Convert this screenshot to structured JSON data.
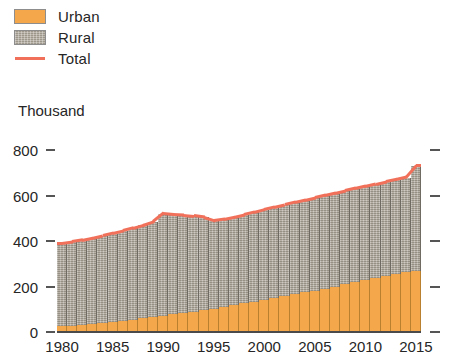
{
  "legend": {
    "items": [
      {
        "label": "Urban",
        "icon": "square-swatch-icon",
        "color": "#F5A84B"
      },
      {
        "label": "Rural",
        "icon": "square-swatch-icon",
        "color": "#AFA89B"
      },
      {
        "label": "Total",
        "icon": "line-swatch-icon",
        "color": "#F0705A"
      }
    ]
  },
  "unit_label": "Thousand",
  "chart_data": {
    "type": "area",
    "title": "",
    "subtitle": "",
    "xlabel": "",
    "ylabel": "Thousand",
    "ylim": [
      0,
      800
    ],
    "xlim": [
      1980,
      2015
    ],
    "grid": false,
    "legend_position": "top-left",
    "y_ticks": [
      0,
      200,
      400,
      600,
      800
    ],
    "y_tick_labels": [
      "0",
      "200",
      "400",
      "600",
      "800"
    ],
    "x_ticks": [
      1980,
      1985,
      1990,
      1995,
      2000,
      2005,
      2010,
      2015
    ],
    "x_tick_labels": [
      "1980",
      "1985",
      "1990",
      "1995",
      "2000",
      "2005",
      "2010",
      "2015"
    ],
    "x": [
      1980,
      1981,
      1982,
      1983,
      1984,
      1985,
      1986,
      1987,
      1988,
      1989,
      1990,
      1991,
      1992,
      1993,
      1994,
      1995,
      1996,
      1997,
      1998,
      1999,
      2000,
      2001,
      2002,
      2003,
      2004,
      2005,
      2006,
      2007,
      2008,
      2009,
      2010,
      2011,
      2012,
      2013,
      2014,
      2015
    ],
    "stacked": true,
    "series": [
      {
        "name": "Urban",
        "color": "#F5A84B",
        "values": [
          25,
          28,
          31,
          35,
          39,
          44,
          49,
          54,
          60,
          66,
          72,
          78,
          84,
          90,
          96,
          102,
          110,
          118,
          126,
          134,
          142,
          150,
          158,
          166,
          174,
          182,
          191,
          200,
          209,
          218,
          227,
          236,
          245,
          253,
          262,
          270
        ]
      },
      {
        "name": "Rural",
        "color": "#AFA89B",
        "values": [
          365,
          368,
          372,
          377,
          383,
          389,
          395,
          402,
          409,
          418,
          448,
          438,
          430,
          420,
          408,
          388,
          386,
          387,
          389,
          392,
          396,
          399,
          401,
          404,
          406,
          408,
          409,
          410,
          411,
          412,
          413,
          414,
          415,
          416,
          417,
          460
        ]
      }
    ],
    "total_series": {
      "name": "Total",
      "color": "#F0705A",
      "values": [
        390,
        396,
        403,
        412,
        422,
        433,
        444,
        456,
        469,
        484,
        520,
        516,
        514,
        510,
        504,
        490,
        496,
        505,
        515,
        526,
        538,
        549,
        559,
        570,
        580,
        590,
        600,
        610,
        620,
        630,
        640,
        650,
        660,
        669,
        679,
        730
      ]
    }
  }
}
